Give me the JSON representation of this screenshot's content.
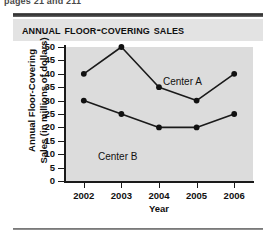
{
  "page": {
    "header_sliver": "pages 21 and 211",
    "top_rule": "top-rule",
    "bottom_rule": "bottom-rule"
  },
  "chart_data": {
    "type": "line",
    "title": "Annual Floor-Covering Sales",
    "xlabel": "Year",
    "ylabel": "Annual Floor-Covering Sales (in millions of dollars)",
    "ylabel_line1": "Annual Floor-Covering",
    "ylabel_line2": "Sales (in millions of dollars)",
    "categories": [
      "2002",
      "2003",
      "2004",
      "2005",
      "2006"
    ],
    "x": [
      2002,
      2003,
      2004,
      2005,
      2006
    ],
    "series": [
      {
        "name": "Center A",
        "values": [
          40,
          50,
          35,
          30,
          40
        ]
      },
      {
        "name": "Center B",
        "values": [
          30,
          25,
          20,
          20,
          25
        ]
      }
    ],
    "yticks": [
      0,
      5,
      10,
      15,
      20,
      25,
      30,
      35,
      40,
      45,
      50
    ],
    "ytick_labels": [
      "0",
      "5",
      "10",
      "15",
      "20",
      "25",
      "30",
      "35",
      "40",
      "45",
      "50"
    ],
    "ylim": [
      0,
      50
    ],
    "grid": false,
    "legend_position": "inline-annotation",
    "annotations": [
      {
        "text": "Center A",
        "series": "Center A"
      },
      {
        "text": "Center B",
        "series": "Center B"
      }
    ],
    "colors": {
      "line": "#1a1a1a",
      "marker": "#111111",
      "plot_background": "#dcdcdc",
      "title_band": "#e3e3e3",
      "axis": "#1a1a1a"
    }
  }
}
